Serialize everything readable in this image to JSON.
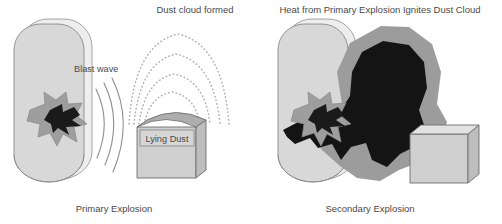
{
  "diagram": {
    "title_left": "Dust cloud formed",
    "title_right": "Heat from Primary Explosion Ignites Dust Cloud",
    "caption_left": "Primary Explosion",
    "caption_right": "Secondary Explosion",
    "label_blast_wave": "Blast wave",
    "label_lying_dust": "Lying Dust"
  },
  "colors": {
    "background": "#ffffff",
    "silo_fill": "#d8d8d8",
    "silo_outline_fill": "#eeeeee",
    "silo_stroke": "#8a8a8a",
    "box_fill": "#cfcfcf",
    "box_top_fill": "#b8b8b8",
    "box_side_fill": "#bdbdbd",
    "box_stroke": "#6e6e6e",
    "star_gray": "#9e9e9e",
    "star_dark": "#1a1a1a",
    "cloud_gray": "#9c9c9c",
    "cloud_dark": "#141414",
    "blast_arc": "#8d8d8d",
    "dotted_arc": "#b0b0b0",
    "text": "#4a4a4a"
  },
  "panels": [
    {
      "id": "primary-explosion-panel",
      "caption": "Primary Explosion",
      "heading": "Dust cloud formed",
      "elements": [
        "silo",
        "explosion-star",
        "blast-wave-arcs",
        "dust-cloud-arcs",
        "lying-dust-box"
      ]
    },
    {
      "id": "secondary-explosion-panel",
      "caption": "Secondary Explosion",
      "heading": "Heat from Primary Explosion Ignites Dust Cloud",
      "elements": [
        "silo",
        "explosion-star",
        "ignited-dust-cloud",
        "empty-box"
      ]
    }
  ]
}
